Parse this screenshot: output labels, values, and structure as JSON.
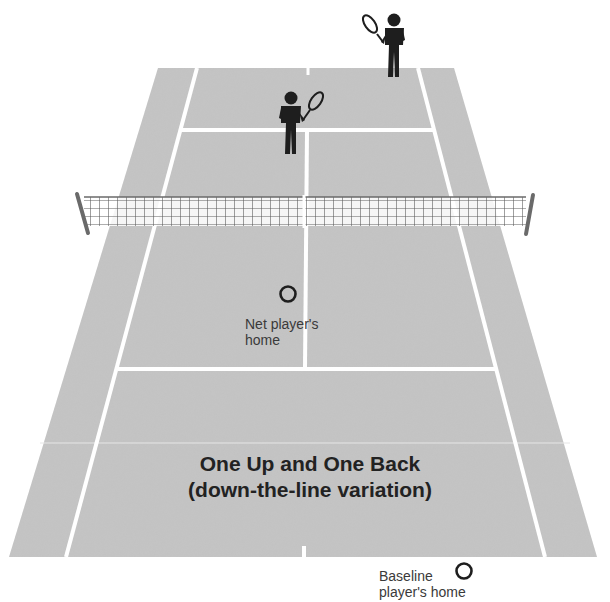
{
  "diagram": {
    "title_line1": "One Up and One Back",
    "title_line2": "(down-the-line variation)",
    "colors": {
      "court": "#c4c4c4",
      "lines": "#ffffff",
      "player": "#1e1e1e",
      "net": "#6a6a6a",
      "text": "#333333"
    },
    "markers": [
      {
        "id": "net-player-home",
        "label_line1": "Net player's",
        "label_line2": "home",
        "shape": "circle"
      },
      {
        "id": "baseline-player-home",
        "label_line1": "Baseline",
        "label_line2": "player's home",
        "shape": "circle"
      }
    ],
    "players": [
      {
        "id": "opponent-at-net",
        "icon": "tennis-player-icon"
      },
      {
        "id": "opponent-at-baseline",
        "icon": "tennis-player-icon"
      }
    ]
  }
}
